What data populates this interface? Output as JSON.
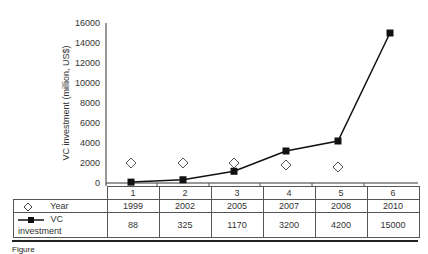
{
  "chart_data": {
    "type": "line",
    "title": "",
    "xlabel": "",
    "ylabel": "VC investment (million, US$)",
    "ylim": [
      0,
      16000
    ],
    "yticks": [
      0,
      2000,
      4000,
      6000,
      8000,
      10000,
      12000,
      14000,
      16000
    ],
    "categories": [
      "1",
      "2",
      "3",
      "4",
      "5",
      "6"
    ],
    "series": [
      {
        "name": "Year",
        "marker": "open-diamond",
        "line": false,
        "values": [
          1999,
          2002,
          2005,
          2007,
          2008,
          2010
        ],
        "plotted_y": [
          2000,
          2000,
          2000,
          1800,
          1600,
          null
        ]
      },
      {
        "name": "VC investment",
        "marker": "filled-square",
        "line": true,
        "values": [
          88,
          325,
          1170,
          3200,
          4200,
          15000
        ]
      }
    ],
    "grid": false,
    "legend_position": "data-table-below"
  },
  "axis": {
    "ylabel": "VC investment (million, US$)",
    "yticks": [
      "0",
      "2000",
      "4000",
      "6000",
      "8000",
      "10000",
      "12000",
      "14000",
      "16000"
    ]
  },
  "table": {
    "header": [
      "1",
      "2",
      "3",
      "4",
      "5",
      "6"
    ],
    "rows": [
      {
        "label": "Year",
        "icon": "open-diamond-icon",
        "values": [
          "1999",
          "2002",
          "2005",
          "2007",
          "2008",
          "2010"
        ]
      },
      {
        "label": "VC investment",
        "icon": "line-square-marker-icon",
        "values": [
          "88",
          "325",
          "1170",
          "3200",
          "4200",
          "15000"
        ]
      }
    ]
  },
  "caption": "Figure"
}
